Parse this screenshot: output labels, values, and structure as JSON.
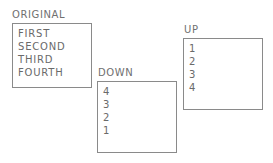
{
  "lists": [
    {
      "title": "ORIGINAL",
      "items": [
        "FIRST",
        "SECOND",
        "THIRD",
        "FOURTH"
      ]
    },
    {
      "title": "DOWN",
      "items": [
        "4",
        "3",
        "2",
        "1"
      ]
    },
    {
      "title": "UP",
      "items": [
        "1",
        "2",
        "3",
        "4"
      ]
    }
  ]
}
